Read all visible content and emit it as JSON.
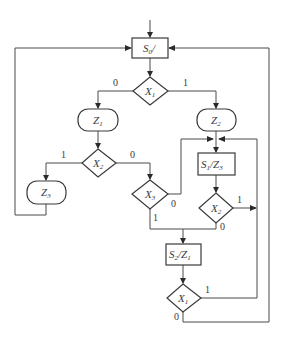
{
  "diagram": {
    "type": "ASM chart",
    "states": {
      "s0": {
        "name": "S",
        "sub": "0",
        "sep": "/",
        "out": "",
        "out_sub": ""
      },
      "s1": {
        "name": "S",
        "sub": "1",
        "sep": "/",
        "out": "Z",
        "out_sub": "3"
      },
      "s2": {
        "name": "S",
        "sub": "2",
        "sep": "/",
        "out": "Z",
        "out_sub": "1"
      }
    },
    "decisions": {
      "x1_top": {
        "name": "X",
        "sub": "1"
      },
      "x2_left": {
        "name": "X",
        "sub": "2"
      },
      "x3": {
        "name": "X",
        "sub": "3"
      },
      "x2_right": {
        "name": "X",
        "sub": "2"
      },
      "x1_bottom": {
        "name": "X",
        "sub": "1"
      }
    },
    "conditional_outputs": {
      "z1": {
        "name": "Z",
        "sub": "1"
      },
      "z2": {
        "name": "Z",
        "sub": "2"
      },
      "z3": {
        "name": "Z",
        "sub": "3"
      }
    },
    "branch_labels": {
      "x1_top_0": "0",
      "x1_top_1": "1",
      "x2_left_1": "1",
      "x2_left_0": "0",
      "x3_0": "0",
      "x3_1": "1",
      "x2_right_1": "1",
      "x2_right_0": "0",
      "x1_bottom_1": "1",
      "x1_bottom_0": "0"
    }
  }
}
